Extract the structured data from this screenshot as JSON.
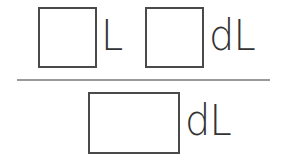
{
  "numerator": {
    "first": {
      "value": "",
      "unit": "L"
    },
    "second": {
      "value": "",
      "unit": "dL"
    }
  },
  "denominator": {
    "answer": {
      "value": "",
      "unit": "dL"
    }
  },
  "colors": {
    "box_border": "#4a4a4a",
    "text": "#333333",
    "divider": "#9a9a9a",
    "background": "#ffffff"
  }
}
